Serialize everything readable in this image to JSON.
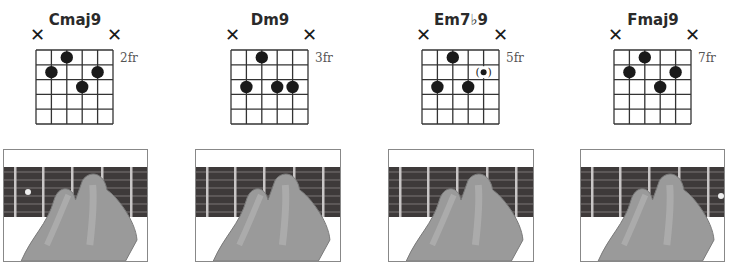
{
  "chords": [
    {
      "name": "Cmaj9",
      "muted": [
        "string-6",
        "string-1"
      ],
      "start_fret_label": "2fr",
      "dots": [
        {
          "string": 3,
          "fret": 1
        },
        {
          "string": 2,
          "fret": 2
        },
        {
          "string": 5,
          "fret": 2
        },
        {
          "string": 4,
          "fret": 3
        }
      ],
      "optional_dots": []
    },
    {
      "name": "Dm9",
      "muted": [
        "string-6",
        "string-1"
      ],
      "start_fret_label": "3fr",
      "dots": [
        {
          "string": 3,
          "fret": 1
        },
        {
          "string": 2,
          "fret": 3
        },
        {
          "string": 4,
          "fret": 3
        },
        {
          "string": 5,
          "fret": 3
        }
      ],
      "optional_dots": []
    },
    {
      "name": "Em7♭9",
      "muted": [
        "string-6",
        "string-1"
      ],
      "start_fret_label": "5fr",
      "dots": [
        {
          "string": 3,
          "fret": 1
        },
        {
          "string": 2,
          "fret": 3
        },
        {
          "string": 4,
          "fret": 3
        }
      ],
      "optional_dots": [
        {
          "string": 5,
          "fret": 2,
          "label": "(•)"
        }
      ]
    },
    {
      "name": "Fmaj9",
      "muted": [
        "string-6",
        "string-1"
      ],
      "start_fret_label": "7fr",
      "dots": [
        {
          "string": 3,
          "fret": 1
        },
        {
          "string": 2,
          "fret": 2
        },
        {
          "string": 5,
          "fret": 2
        },
        {
          "string": 4,
          "fret": 3
        }
      ],
      "optional_dots": []
    }
  ],
  "mute_symbol": "✕",
  "photos": [
    {
      "alt": "Hand fretting Cmaj9 chord on guitar neck"
    },
    {
      "alt": "Hand fretting Dm9 chord on guitar neck"
    },
    {
      "alt": "Hand fretting Em7♭9 chord on guitar neck"
    },
    {
      "alt": "Hand fretting Fmaj9 chord on guitar neck"
    }
  ]
}
